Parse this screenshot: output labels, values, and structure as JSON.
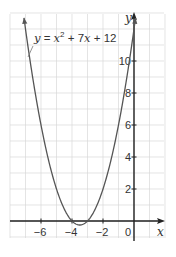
{
  "chart_data": {
    "type": "line",
    "title": "",
    "equation": "y = x^2 + 7x + 12",
    "equation_parts": {
      "y": "y",
      "eq": " = ",
      "x1": "x",
      "exp": "2",
      "plus1": " + 7",
      "x2": "x",
      "plus2": " + 12"
    },
    "xlabel": "x",
    "ylabel": "y",
    "xlim": [
      -8,
      2
    ],
    "ylim": [
      -1,
      13
    ],
    "grid": true,
    "x_ticks": [
      {
        "value": -6,
        "label": "−6"
      },
      {
        "value": -4,
        "label": "−4"
      },
      {
        "value": -2,
        "label": "−2"
      },
      {
        "value": 0,
        "label": "0"
      }
    ],
    "y_ticks": [
      {
        "value": 2,
        "label": "2"
      },
      {
        "value": 4,
        "label": "4"
      },
      {
        "value": 6,
        "label": "6"
      },
      {
        "value": 8,
        "label": "8"
      },
      {
        "value": 10,
        "label": "10"
      }
    ],
    "series": [
      {
        "name": "y = x^2 + 7x + 12",
        "coefficients": {
          "a": 1,
          "b": 7,
          "c": 12
        },
        "roots": [
          -4,
          -3
        ],
        "vertex": [
          -3.5,
          -0.25
        ],
        "y_intercept": 12
      }
    ],
    "colors": {
      "curve": "#555555",
      "axis": "#222222",
      "grid": "#d9d9d9"
    }
  }
}
